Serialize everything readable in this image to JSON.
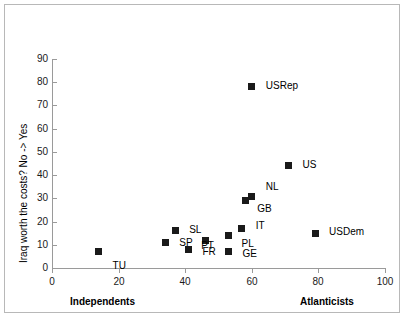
{
  "chart_data": {
    "type": "scatter",
    "title": "",
    "xlabel": "",
    "ylabel": "Iraq worth the costs? No -> Yes",
    "xlim": [
      0,
      100
    ],
    "ylim": [
      0,
      90
    ],
    "xticks": [
      0,
      20,
      40,
      60,
      80,
      100
    ],
    "yticks": [
      0,
      10,
      20,
      30,
      40,
      50,
      60,
      70,
      80,
      90
    ],
    "grid": false,
    "legend": "none",
    "axis_end_labels": {
      "x_left": "Independents",
      "x_right": "Atlanticists"
    },
    "marker_color": "#1a1a1a",
    "marker_shape": "square",
    "points": [
      {
        "label": "TU",
        "x": 14,
        "y": 7,
        "lx": 14,
        "ly": 14
      },
      {
        "label": "SP",
        "x": 34,
        "y": 11,
        "lx": 14,
        "ly": 1
      },
      {
        "label": "SL",
        "x": 37,
        "y": 16,
        "lx": 14,
        "ly": -1
      },
      {
        "label": "FR",
        "x": 41,
        "y": 8,
        "lx": 14,
        "ly": 3
      },
      {
        "label": "PT",
        "x": 46,
        "y": 12,
        "lx": -4,
        "ly": 6
      },
      {
        "label": "PL",
        "x": 53,
        "y": 14,
        "lx": 13,
        "ly": 9
      },
      {
        "label": "GE",
        "x": 53,
        "y": 7,
        "lx": 14,
        "ly": 2
      },
      {
        "label": "IT",
        "x": 57,
        "y": 17,
        "lx": 14,
        "ly": -3
      },
      {
        "label": "GB",
        "x": 58,
        "y": 29,
        "lx": 12,
        "ly": 8
      },
      {
        "label": "NL",
        "x": 60,
        "y": 31,
        "lx": 14,
        "ly": -9
      },
      {
        "label": "USRep",
        "x": 60,
        "y": 78,
        "lx": 14,
        "ly": -1
      },
      {
        "label": "US",
        "x": 71,
        "y": 44,
        "lx": 14,
        "ly": -1
      },
      {
        "label": "USDem",
        "x": 79,
        "y": 15,
        "lx": 14,
        "ly": -1
      }
    ]
  }
}
